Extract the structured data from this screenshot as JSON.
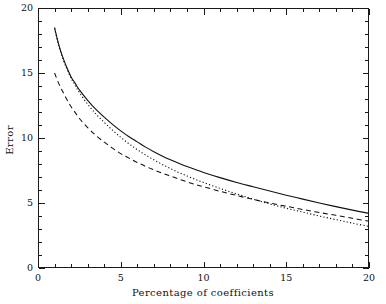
{
  "chart_data": {
    "type": "line",
    "title": "",
    "xlabel": "Percentage of coefficients",
    "ylabel": "Error",
    "xlim": [
      0,
      20
    ],
    "ylim": [
      0,
      20
    ],
    "xticks": [
      0,
      5,
      10,
      15,
      20
    ],
    "xtick_labels": [
      "0",
      "5",
      "10",
      "15",
      "20"
    ],
    "yticks": [
      0,
      5,
      10,
      15,
      20
    ],
    "ytick_labels": [
      "0",
      "5",
      "10",
      "15",
      "20"
    ],
    "minor_tick_interval": 1,
    "grid": false,
    "legend": "none",
    "background_color": "#ffffff",
    "line_color": "#111111",
    "series": [
      {
        "name": "solid",
        "style": "solid",
        "x": [
          1,
          1.25,
          1.5,
          1.75,
          2,
          2.25,
          2.5,
          3,
          3.5,
          4,
          4.5,
          5,
          5.5,
          6,
          6.5,
          7,
          7.5,
          8,
          8.5,
          9,
          9.5,
          10,
          11,
          12,
          13,
          14,
          15,
          16,
          17,
          18,
          19,
          20
        ],
        "y": [
          18.5,
          17.2,
          16.2,
          15.4,
          14.7,
          14.2,
          13.7,
          12.9,
          12.2,
          11.6,
          11.05,
          10.55,
          10.1,
          9.7,
          9.3,
          8.95,
          8.62,
          8.32,
          8.05,
          7.8,
          7.57,
          7.35,
          6.95,
          6.58,
          6.25,
          5.92,
          5.6,
          5.3,
          5.0,
          4.72,
          4.45,
          4.2
        ]
      },
      {
        "name": "dotted",
        "style": "dotted",
        "x": [
          1,
          1.25,
          1.5,
          1.75,
          2,
          2.25,
          2.5,
          3,
          3.5,
          4,
          4.5,
          5,
          5.5,
          6,
          6.5,
          7,
          7.5,
          8,
          8.5,
          9,
          9.5,
          10,
          11,
          12,
          13,
          14,
          15,
          16,
          17,
          18,
          19,
          20
        ],
        "y": [
          18.45,
          17.1,
          16.1,
          15.3,
          14.6,
          14.05,
          13.5,
          12.6,
          11.85,
          11.2,
          10.6,
          10.05,
          9.55,
          9.1,
          8.7,
          8.32,
          7.97,
          7.65,
          7.35,
          7.08,
          6.82,
          6.58,
          6.12,
          5.7,
          5.3,
          4.93,
          4.6,
          4.3,
          4.0,
          3.72,
          3.45,
          3.2
        ]
      },
      {
        "name": "dashed",
        "style": "dashed",
        "x": [
          1,
          1.25,
          1.5,
          1.75,
          2,
          2.25,
          2.5,
          3,
          3.5,
          4,
          4.5,
          5,
          5.5,
          6,
          6.5,
          7,
          7.5,
          8,
          8.5,
          9,
          9.5,
          10,
          11,
          12,
          13,
          14,
          15,
          16,
          17,
          18,
          19,
          20
        ],
        "y": [
          15.0,
          14.2,
          13.55,
          12.95,
          12.4,
          11.95,
          11.5,
          10.8,
          10.2,
          9.68,
          9.22,
          8.8,
          8.45,
          8.12,
          7.82,
          7.55,
          7.3,
          7.07,
          6.85,
          6.63,
          6.43,
          6.25,
          5.9,
          5.58,
          5.28,
          5.0,
          4.75,
          4.5,
          4.27,
          4.05,
          3.82,
          3.6
        ]
      }
    ]
  },
  "figure": {
    "plot_left_px": 38,
    "plot_right_px": 369,
    "plot_top_px": 8,
    "plot_bottom_px": 268
  }
}
